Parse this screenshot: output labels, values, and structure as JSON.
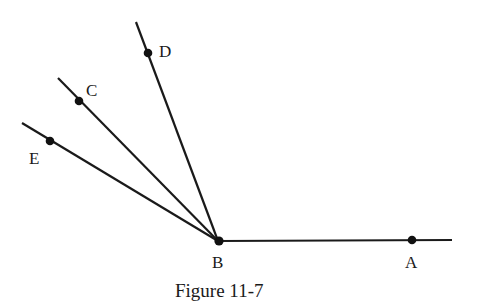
{
  "figure": {
    "caption": "Figure 11-7",
    "vertex": "B",
    "rays": [
      {
        "name": "BA",
        "point": "A"
      },
      {
        "name": "BD",
        "point": "D"
      },
      {
        "name": "BC",
        "point": "C"
      },
      {
        "name": "BE",
        "point": "E"
      }
    ],
    "points": {
      "A": {
        "label": "A"
      },
      "B": {
        "label": "B"
      },
      "C": {
        "label": "C"
      },
      "D": {
        "label": "D"
      },
      "E": {
        "label": "E"
      }
    }
  },
  "colors": {
    "line": "#1a1a1a",
    "point": "#111111",
    "background": "#ffffff"
  }
}
